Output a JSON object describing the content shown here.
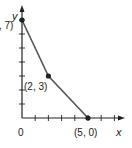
{
  "chart_data": {
    "type": "line",
    "title": "",
    "xlabel": "x",
    "ylabel": "y",
    "origin_label": "0",
    "xlim": [
      0,
      8
    ],
    "ylim": [
      0,
      7.5
    ],
    "grid": false,
    "x_ticks": [
      1,
      2,
      3,
      4,
      5,
      6,
      7
    ],
    "y_ticks": [
      1,
      2,
      3,
      4,
      5,
      6,
      7
    ],
    "series": [
      {
        "name": "segment",
        "points": [
          {
            "x": 0,
            "y": 7,
            "label": "(0, 7)"
          },
          {
            "x": 2,
            "y": 3,
            "label": "(2, 3)"
          },
          {
            "x": 5,
            "y": 0,
            "label": "(5, 0)"
          }
        ]
      }
    ],
    "colors": {
      "line": "#555555",
      "axis": "#222222",
      "point": "#222222"
    }
  }
}
